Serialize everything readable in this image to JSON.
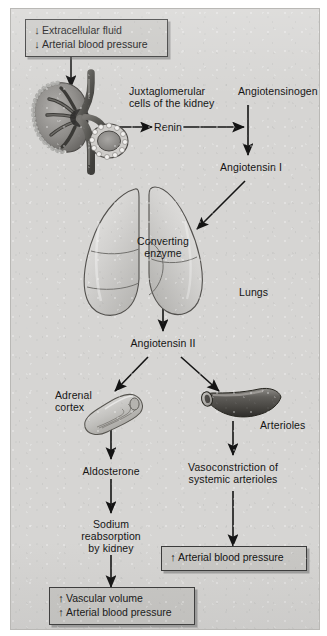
{
  "figure": {
    "background_color": "#d6d5d3",
    "box_fill_color": "#c9c8c5",
    "line_color": "#141414"
  },
  "glyphs": {
    "arrow_down": "↓",
    "arrow_up": "↑"
  },
  "boxes": {
    "stimulus": {
      "name": "decreased-fluid-and-pressure-box",
      "lines": [
        {
          "arrow": "↓",
          "text": "Extracellular fluid"
        },
        {
          "arrow": "↓",
          "text": "Arterial blood pressure"
        }
      ]
    },
    "outcome_volume": {
      "name": "increased-volume-and-pressure-box",
      "lines": [
        {
          "arrow": "↑",
          "text": "Vascular volume"
        },
        {
          "arrow": "↑",
          "text": "Arterial blood pressure"
        }
      ]
    },
    "outcome_pressure": {
      "name": "increased-arterial-pressure-box",
      "lines": [
        {
          "arrow": "↑",
          "text": "Arterial blood pressure"
        }
      ]
    }
  },
  "labels": {
    "juxtaglomerular_line1": "Juxtaglomerular",
    "juxtaglomerular_line2": "cells of the kidney",
    "angiotensinogen": "Angiotensinogen",
    "renin": "Renin",
    "angiotensin_i": "Angiotensin I",
    "converting_enzyme_line1": "Converting",
    "converting_enzyme_line2": "enzyme",
    "lungs": "Lungs",
    "angiotensin_ii": "Angiotensin II",
    "adrenal_cortex_line1": "Adrenal",
    "adrenal_cortex_line2": "cortex",
    "arterioles": "Arterioles",
    "aldosterone": "Aldosterone",
    "vasoconstriction_line1": "Vasoconstriction of",
    "vasoconstriction_line2": "systemic arterioles",
    "sodium_line1": "Sodium",
    "sodium_line2": "reabsorption",
    "sodium_line3": "by kidney"
  },
  "illustrations": {
    "kidney_nephron": "juxtaglomerular-apparatus-illustration",
    "lungs": "lungs-illustration",
    "adrenal_gland": "adrenal-gland-illustration",
    "arteriole_vessel": "arteriole-vessel-illustration"
  }
}
